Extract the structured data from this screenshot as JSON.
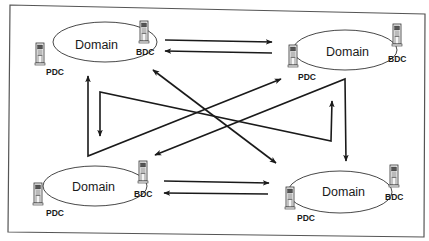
{
  "diagram": {
    "title": "",
    "colors": {
      "line": "#1a1a1a",
      "frame": "#555555",
      "background": "#ffffff"
    },
    "domains": [
      {
        "id": "top-left",
        "label": "Domain",
        "pdc_label": "PDC",
        "bdc_label": "BDC",
        "cx": 105,
        "cy": 42,
        "rx": 52,
        "ry": 20
      },
      {
        "id": "top-right",
        "label": "Domain",
        "pdc_label": "PDC",
        "bdc_label": "BDC",
        "cx": 345,
        "cy": 50,
        "rx": 52,
        "ry": 20
      },
      {
        "id": "bottom-left",
        "label": "Domain",
        "pdc_label": "PDC",
        "bdc_label": "BDC",
        "cx": 95,
        "cy": 186,
        "rx": 52,
        "ry": 20
      },
      {
        "id": "bottom-right",
        "label": "Domain",
        "pdc_label": "PDC",
        "bdc_label": "BDC",
        "cx": 340,
        "cy": 192,
        "rx": 52,
        "ry": 21
      }
    ],
    "connections": [
      {
        "from": "top-left",
        "to": "top-right",
        "type": "one-way"
      },
      {
        "from": "top-right",
        "to": "top-left",
        "type": "one-way"
      },
      {
        "from": "bottom-left",
        "to": "bottom-right",
        "type": "one-way"
      },
      {
        "from": "bottom-right",
        "to": "bottom-left",
        "type": "one-way"
      },
      {
        "from": "top-left",
        "to": "bottom-right",
        "type": "two-way"
      },
      {
        "from": "bottom-left",
        "to": "top-right",
        "type": "two-way"
      },
      {
        "from": "top-left",
        "to": "bottom-left",
        "type": "two-way"
      },
      {
        "from": "top-right",
        "to": "bottom-right",
        "type": "two-way"
      }
    ]
  }
}
